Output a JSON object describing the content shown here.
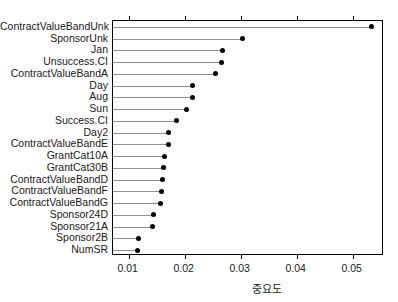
{
  "chart_data": {
    "type": "bar",
    "variant": "lollipop-dotplot-horizontal",
    "title": "",
    "subtitle": "",
    "xlabel": "중요도",
    "ylabel": "",
    "xlim": [
      0.0072,
      0.0556
    ],
    "xticks": [
      0.01,
      0.02,
      0.03,
      0.04,
      0.05
    ],
    "xticklabels": [
      "0.01",
      "0.02",
      "0.03",
      "0.04",
      "0.05"
    ],
    "grid": false,
    "legend": null,
    "orientation": "horizontal",
    "sorted": "descending",
    "categories": [
      "ContractValueBandUnk",
      "SponsorUnk",
      "Jan",
      "Unsuccess.CI",
      "ContractValueBandA",
      "Day",
      "Aug",
      "Sun",
      "Success.CI",
      "Day2",
      "ContractValueBandE",
      "GrantCat10A",
      "GrantCat30B",
      "ContractValueBandD",
      "ContractValueBandF",
      "ContractValueBandG",
      "Sponsor24D",
      "Sponsor21A",
      "Sponsor2B",
      "NumSR"
    ],
    "values": [
      0.0533,
      0.0304,
      0.0268,
      0.0266,
      0.0255,
      0.0214,
      0.0214,
      0.0204,
      0.0186,
      0.0171,
      0.0171,
      0.0164,
      0.0163,
      0.0161,
      0.0159,
      0.0157,
      0.0145,
      0.0143,
      0.0118,
      0.0116
    ],
    "series": [
      {
        "name": "중요도",
        "values": [
          0.0533,
          0.0304,
          0.0268,
          0.0266,
          0.0255,
          0.0214,
          0.0214,
          0.0204,
          0.0186,
          0.0171,
          0.0171,
          0.0164,
          0.0163,
          0.0161,
          0.0159,
          0.0157,
          0.0145,
          0.0143,
          0.0118,
          0.0116
        ]
      }
    ],
    "colors": {
      "point": "#000000",
      "stem": "#8f8f8f",
      "axis": "#000000",
      "background": "#ffffff",
      "text": "#1a1a1a"
    }
  }
}
